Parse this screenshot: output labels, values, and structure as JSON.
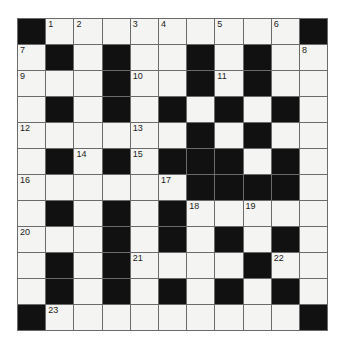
{
  "puzzle": {
    "kind": "crossword-grid",
    "rows": 12,
    "cols": 11,
    "colors": {
      "line": "#6b6b6b",
      "black_cell": "#111111",
      "white_cell": "#f4f4f2",
      "number_text": "#1c1c1c",
      "page_background": "#ffffff"
    },
    "grid": [
      [
        "B",
        "1",
        "2",
        "",
        "3",
        "4",
        "",
        "5",
        "",
        "6",
        "B"
      ],
      [
        "7",
        "B",
        "",
        "B",
        "",
        "",
        "B",
        "",
        "B",
        "",
        "8"
      ],
      [
        "9",
        "",
        "",
        "B",
        "10",
        "",
        "B",
        "11",
        "B",
        "",
        ""
      ],
      [
        "",
        "B",
        "",
        "B",
        "",
        "B",
        "",
        "B",
        "",
        "B",
        ""
      ],
      [
        "12",
        "",
        "",
        "",
        "13",
        "",
        "B",
        "",
        "B",
        "",
        ""
      ],
      [
        "",
        "B",
        "14",
        "B",
        "15",
        "B",
        "B",
        "B",
        "",
        "B",
        ""
      ],
      [
        "16",
        "",
        "",
        "",
        "",
        "17",
        "B",
        "B",
        "B",
        "B",
        ""
      ],
      [
        "",
        "B",
        "",
        "B",
        "",
        "B",
        "18",
        "",
        "19",
        "",
        ""
      ],
      [
        "20",
        "",
        "",
        "B",
        "",
        "B",
        "",
        "B",
        "",
        "B",
        ""
      ],
      [
        "",
        "B",
        "",
        "B",
        "21",
        "",
        "",
        "",
        "B",
        "22",
        ""
      ],
      [
        "",
        "B",
        "",
        "B",
        "",
        "B",
        "",
        "B",
        "",
        "B",
        ""
      ],
      [
        "B",
        "23",
        "",
        "",
        "",
        "",
        "",
        "",
        "",
        "",
        "B"
      ]
    ],
    "visible_clue_numbers": [
      "1",
      "2",
      "3",
      "4",
      "5",
      "6",
      "7",
      "8",
      "9",
      "10",
      "11",
      "12",
      "13",
      "14",
      "15",
      "16",
      "17",
      "18",
      "19",
      "20",
      "21",
      "22",
      "23"
    ]
  }
}
